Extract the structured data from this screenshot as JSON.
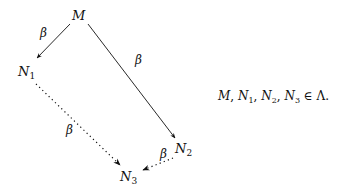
{
  "diagram": {
    "type": "reduction-diamond",
    "nodes": [
      {
        "id": "M",
        "label": "M",
        "sub": "",
        "x": 78,
        "y": 19
      },
      {
        "id": "N1",
        "label": "N",
        "sub": "1",
        "x": 24,
        "y": 75
      },
      {
        "id": "N2",
        "label": "N",
        "sub": "2",
        "x": 180,
        "y": 153
      },
      {
        "id": "N3",
        "label": "N",
        "sub": "3",
        "x": 125,
        "y": 181
      }
    ],
    "edges": [
      {
        "from": "M",
        "to": "N1",
        "label": "β",
        "style": "solid"
      },
      {
        "from": "M",
        "to": "N2",
        "label": "β",
        "style": "solid"
      },
      {
        "from": "N1",
        "to": "N3",
        "label": "β",
        "style": "dotted"
      },
      {
        "from": "N2",
        "to": "N3",
        "label": "β",
        "style": "dotted"
      }
    ],
    "edge_label": "β"
  },
  "equation": {
    "terms": [
      "M",
      "N",
      "N",
      "N"
    ],
    "subs": [
      "",
      "1",
      "2",
      "3"
    ],
    "relation": "∈",
    "set": "Λ",
    "end": "."
  }
}
